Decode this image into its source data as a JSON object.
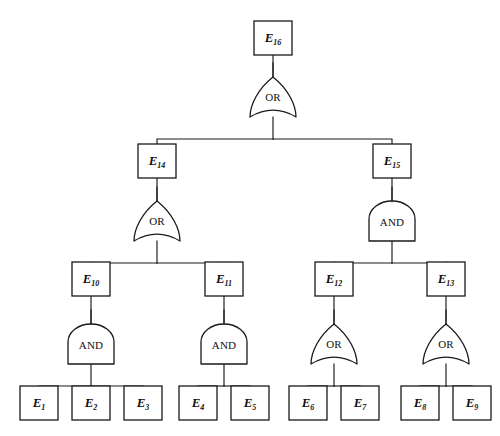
{
  "diagram": {
    "type": "fault-tree",
    "title": "",
    "gate_types": {
      "or": "OR",
      "and": "AND"
    },
    "events": [
      {
        "id": "E16",
        "label": "E",
        "sub": "16",
        "x": 273,
        "y": 38,
        "w": 38,
        "h": 34
      },
      {
        "id": "E14",
        "label": "E",
        "sub": "14",
        "x": 157,
        "y": 161,
        "w": 38,
        "h": 34
      },
      {
        "id": "E15",
        "label": "E",
        "sub": "15",
        "x": 392,
        "y": 161,
        "w": 38,
        "h": 34
      },
      {
        "id": "E10",
        "label": "E",
        "sub": "10",
        "x": 91,
        "y": 279,
        "w": 38,
        "h": 34
      },
      {
        "id": "E11",
        "label": "E",
        "sub": "11",
        "x": 224,
        "y": 279,
        "w": 38,
        "h": 34
      },
      {
        "id": "E12",
        "label": "E",
        "sub": "12",
        "x": 334,
        "y": 279,
        "w": 38,
        "h": 34
      },
      {
        "id": "E13",
        "label": "E",
        "sub": "13",
        "x": 446,
        "y": 279,
        "w": 38,
        "h": 34
      },
      {
        "id": "E1",
        "label": "E",
        "sub": "1",
        "x": 39,
        "y": 403,
        "w": 38,
        "h": 34
      },
      {
        "id": "E2",
        "label": "E",
        "sub": "2",
        "x": 91,
        "y": 403,
        "w": 38,
        "h": 34
      },
      {
        "id": "E3",
        "label": "E",
        "sub": "3",
        "x": 143,
        "y": 403,
        "w": 38,
        "h": 34
      },
      {
        "id": "E4",
        "label": "E",
        "sub": "4",
        "x": 198,
        "y": 403,
        "w": 38,
        "h": 34
      },
      {
        "id": "E5",
        "label": "E",
        "sub": "5",
        "x": 250,
        "y": 403,
        "w": 38,
        "h": 34
      },
      {
        "id": "E6",
        "label": "E",
        "sub": "6",
        "x": 308,
        "y": 403,
        "w": 38,
        "h": 34
      },
      {
        "id": "E7",
        "label": "E",
        "sub": "7",
        "x": 360,
        "y": 403,
        "w": 38,
        "h": 34
      },
      {
        "id": "E8",
        "label": "E",
        "sub": "8",
        "x": 420,
        "y": 403,
        "w": 38,
        "h": 34
      },
      {
        "id": "E9",
        "label": "E",
        "sub": "9",
        "x": 472,
        "y": 403,
        "w": 38,
        "h": 34
      }
    ],
    "gates": [
      {
        "id": "G16",
        "kind": "or",
        "label": "OR",
        "x": 273,
        "y": 97,
        "parent": "E16",
        "children": [
          "E14",
          "E15"
        ]
      },
      {
        "id": "G14",
        "kind": "or",
        "label": "OR",
        "x": 157,
        "y": 221,
        "parent": "E14",
        "children": [
          "E10",
          "E11"
        ]
      },
      {
        "id": "G15",
        "kind": "and",
        "label": "AND",
        "x": 392,
        "y": 221,
        "parent": "E15",
        "children": [
          "E12",
          "E13"
        ]
      },
      {
        "id": "G10",
        "kind": "and",
        "label": "AND",
        "x": 91,
        "y": 344,
        "parent": "E10",
        "children": [
          "E1",
          "E2",
          "E3"
        ]
      },
      {
        "id": "G11",
        "kind": "and",
        "label": "AND",
        "x": 224,
        "y": 344,
        "parent": "E11",
        "children": [
          "E4",
          "E5"
        ]
      },
      {
        "id": "G12",
        "kind": "or",
        "label": "OR",
        "x": 334,
        "y": 344,
        "parent": "E12",
        "children": [
          "E6",
          "E7"
        ]
      },
      {
        "id": "G13",
        "kind": "or",
        "label": "OR",
        "x": 446,
        "y": 344,
        "parent": "E13",
        "children": [
          "E8",
          "E9"
        ]
      }
    ],
    "edges": [
      {
        "from": "E16",
        "to": "G16"
      },
      {
        "from": "G16",
        "to": "E14"
      },
      {
        "from": "G16",
        "to": "E15"
      },
      {
        "from": "E14",
        "to": "G14"
      },
      {
        "from": "G14",
        "to": "E10"
      },
      {
        "from": "G14",
        "to": "E11"
      },
      {
        "from": "E15",
        "to": "G15"
      },
      {
        "from": "G15",
        "to": "E12"
      },
      {
        "from": "G15",
        "to": "E13"
      },
      {
        "from": "E10",
        "to": "G10"
      },
      {
        "from": "G10",
        "to": "E1"
      },
      {
        "from": "G10",
        "to": "E2"
      },
      {
        "from": "G10",
        "to": "E3"
      },
      {
        "from": "E11",
        "to": "G11"
      },
      {
        "from": "G11",
        "to": "E4"
      },
      {
        "from": "G11",
        "to": "E5"
      },
      {
        "from": "E12",
        "to": "G12"
      },
      {
        "from": "G12",
        "to": "E6"
      },
      {
        "from": "G12",
        "to": "E7"
      },
      {
        "from": "E13",
        "to": "G13"
      },
      {
        "from": "G13",
        "to": "E8"
      },
      {
        "from": "G13",
        "to": "E9"
      }
    ],
    "colors": {
      "stroke": "#1a1a1a",
      "fill": "#ffffff",
      "background": "#ffffff"
    }
  }
}
